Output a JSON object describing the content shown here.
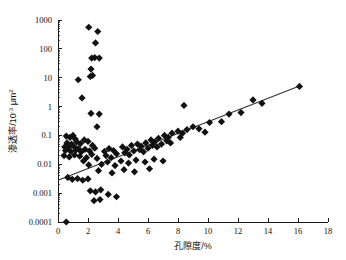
{
  "chart_data": {
    "type": "scatter",
    "title": "",
    "xlabel": "孔隙度/%",
    "ylabel": "渗透率/10⁻³ μm²",
    "ylabel_parts": {
      "prefix": "渗透率/10",
      "exponent": "-3",
      "suffix": " μm"
    },
    "ylabel_suffix_exponent": "2",
    "xlim": [
      0,
      18
    ],
    "ylim": [
      0.0001,
      1000
    ],
    "yscale": "log",
    "xscale": "linear",
    "grid": false,
    "legend": null,
    "xticks": [
      0,
      2,
      4,
      6,
      8,
      10,
      12,
      14,
      16,
      18
    ],
    "xtick_labels": [
      "0",
      "2",
      "4",
      "6",
      "8",
      "10",
      "12",
      "14",
      "16",
      "18"
    ],
    "yticks": [
      0.0001,
      0.001,
      0.01,
      0.1,
      1,
      10,
      100,
      1000
    ],
    "ytick_labels": [
      "0.0001",
      "0.001",
      "0.01",
      "0.1",
      "1",
      "10",
      "100",
      "1000"
    ],
    "marker": "diamond",
    "marker_color": "#111111",
    "marker_size": 3.6,
    "trendline": {
      "visible": true,
      "color": "#333333",
      "x_start": 0.0,
      "y_start": 0.0028,
      "x_end": 16.1,
      "y_end": 5.2
    },
    "series": [
      {
        "name": "孔渗关系",
        "points": [
          [
            2.05,
            560
          ],
          [
            2.65,
            400
          ],
          [
            2.5,
            160
          ],
          [
            2.25,
            48
          ],
          [
            2.45,
            50
          ],
          [
            2.75,
            48
          ],
          [
            2.2,
            20
          ],
          [
            1.35,
            8.5
          ],
          [
            2.15,
            11
          ],
          [
            2.3,
            12
          ],
          [
            1.6,
            2.0
          ],
          [
            8.4,
            1.1
          ],
          [
            13.0,
            1.7
          ],
          [
            2.2,
            0.58
          ],
          [
            2.75,
            0.55
          ],
          [
            2.6,
            0.2
          ],
          [
            0.55,
            0.095
          ],
          [
            0.8,
            0.085
          ],
          [
            1.0,
            0.1
          ],
          [
            1.15,
            0.075
          ],
          [
            0.6,
            0.055
          ],
          [
            0.9,
            0.05
          ],
          [
            1.25,
            0.06
          ],
          [
            1.5,
            0.052
          ],
          [
            0.45,
            0.04
          ],
          [
            0.7,
            0.038
          ],
          [
            1.05,
            0.042
          ],
          [
            1.35,
            0.035
          ],
          [
            0.5,
            0.03
          ],
          [
            0.85,
            0.028
          ],
          [
            1.2,
            0.031
          ],
          [
            1.55,
            0.027
          ],
          [
            1.75,
            0.07
          ],
          [
            2.0,
            0.062
          ],
          [
            2.3,
            0.045
          ],
          [
            1.8,
            0.033
          ],
          [
            2.1,
            0.029
          ],
          [
            2.45,
            0.036
          ],
          [
            0.4,
            0.02
          ],
          [
            0.75,
            0.018
          ],
          [
            1.1,
            0.021
          ],
          [
            1.45,
            0.019
          ],
          [
            1.9,
            0.017
          ],
          [
            2.25,
            0.022
          ],
          [
            2.6,
            0.016
          ],
          [
            3.1,
            0.028
          ],
          [
            3.4,
            0.035
          ],
          [
            3.7,
            0.03
          ],
          [
            3.2,
            0.02
          ],
          [
            3.55,
            0.017
          ],
          [
            3.9,
            0.023
          ],
          [
            4.3,
            0.04
          ],
          [
            4.6,
            0.033
          ],
          [
            4.9,
            0.045
          ],
          [
            4.45,
            0.025
          ],
          [
            4.75,
            0.021
          ],
          [
            5.05,
            0.029
          ],
          [
            5.3,
            0.05
          ],
          [
            5.55,
            0.042
          ],
          [
            5.85,
            0.055
          ],
          [
            5.45,
            0.032
          ],
          [
            5.7,
            0.027
          ],
          [
            6.0,
            0.036
          ],
          [
            6.2,
            0.07
          ],
          [
            6.45,
            0.06
          ],
          [
            6.7,
            0.08
          ],
          [
            6.3,
            0.045
          ],
          [
            6.6,
            0.04
          ],
          [
            6.9,
            0.05
          ],
          [
            7.1,
            0.1
          ],
          [
            7.35,
            0.085
          ],
          [
            7.6,
            0.12
          ],
          [
            7.25,
            0.065
          ],
          [
            7.5,
            0.055
          ],
          [
            8.0,
            0.14
          ],
          [
            8.3,
            0.12
          ],
          [
            8.6,
            0.16
          ],
          [
            8.15,
            0.085
          ],
          [
            9.0,
            0.2
          ],
          [
            9.4,
            0.17
          ],
          [
            2.9,
            0.01
          ],
          [
            3.3,
            0.012
          ],
          [
            3.8,
            0.009
          ],
          [
            4.2,
            0.013
          ],
          [
            4.7,
            0.011
          ],
          [
            5.2,
            0.014
          ],
          [
            5.8,
            0.012
          ],
          [
            6.4,
            0.015
          ],
          [
            7.0,
            0.013
          ],
          [
            2.7,
            0.006
          ],
          [
            3.6,
            0.005
          ],
          [
            4.4,
            0.0065
          ],
          [
            5.1,
            0.0055
          ],
          [
            6.1,
            0.007
          ],
          [
            0.65,
            0.0035
          ],
          [
            0.95,
            0.003
          ],
          [
            1.3,
            0.0032
          ],
          [
            1.65,
            0.0028
          ],
          [
            2.0,
            0.0031
          ],
          [
            2.15,
            0.0012
          ],
          [
            2.5,
            0.0011
          ],
          [
            2.85,
            0.0013
          ],
          [
            3.35,
            0.0009
          ],
          [
            2.4,
            0.00055
          ],
          [
            2.8,
            0.0006
          ],
          [
            3.9,
            0.00075
          ],
          [
            0.55,
            0.0001
          ],
          [
            10.1,
            0.28
          ],
          [
            10.9,
            0.3
          ],
          [
            11.4,
            0.55
          ],
          [
            12.2,
            0.62
          ],
          [
            13.6,
            1.3
          ],
          [
            16.1,
            5.0
          ],
          [
            9.8,
            0.13
          ],
          [
            1.7,
            0.013
          ],
          [
            2.05,
            0.0095
          ]
        ]
      }
    ]
  }
}
